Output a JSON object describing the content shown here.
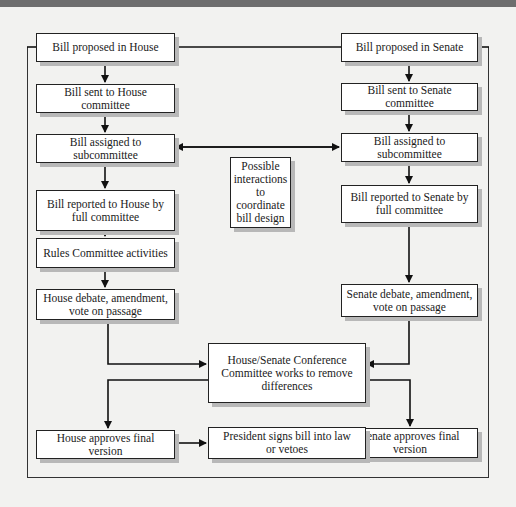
{
  "diagram": {
    "type": "flowchart",
    "title": "",
    "house": {
      "proposed": "Bill proposed in House",
      "sent": "Bill sent to House committee",
      "assigned": "Bill assigned to subcommittee",
      "reported": "Bill reported to House by full committee",
      "rules": "Rules Committee activities",
      "debate": "House debate, amendment, vote on passage",
      "approves": "House approves final version"
    },
    "senate": {
      "proposed": "Bill proposed in Senate",
      "sent": "Bill sent to Senate committee",
      "assigned": "Bill assigned to subcommittee",
      "reported": "Bill reported to Senate by full committee",
      "debate": "Senate debate, amendment, vote on passage",
      "approves": "Senate approves final version"
    },
    "interaction_note": "Possible interactions to coordinate bill design",
    "conference": "House/Senate Conference Committee works to remove differences",
    "president": "President signs bill into law or vetoes",
    "edges": [
      [
        "house.proposed",
        "house.sent"
      ],
      [
        "house.sent",
        "house.assigned"
      ],
      [
        "house.assigned",
        "house.reported"
      ],
      [
        "house.reported",
        "house.rules"
      ],
      [
        "house.rules",
        "house.debate"
      ],
      [
        "house.debate",
        "conference"
      ],
      [
        "senate.proposed",
        "senate.sent"
      ],
      [
        "senate.sent",
        "senate.assigned"
      ],
      [
        "senate.assigned",
        "senate.reported"
      ],
      [
        "senate.reported",
        "senate.debate"
      ],
      [
        "senate.debate",
        "conference"
      ],
      [
        "house.assigned",
        "senate.assigned",
        "bidirectional"
      ],
      [
        "conference",
        "house.approves"
      ],
      [
        "conference",
        "senate.approves"
      ],
      [
        "house.approves",
        "president"
      ],
      [
        "senate.approves",
        "president"
      ]
    ]
  },
  "colors": {
    "background": "#f2f2f0",
    "box_fill": "#ffffff",
    "border": "#222222",
    "shadow": "#b8b8b8",
    "topbar": "#6e6e6e"
  }
}
